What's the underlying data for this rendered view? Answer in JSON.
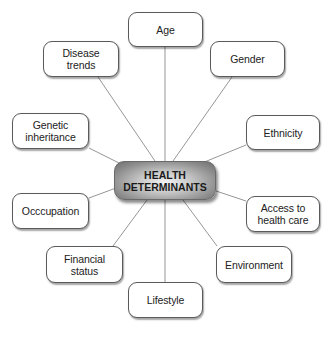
{
  "diagram": {
    "type": "mind-map",
    "center": {
      "label": "HEALTH\nDETERMINANTS",
      "x": 114,
      "y": 161,
      "w": 102,
      "h": 39
    },
    "line_color": "#8a8a8a",
    "nodes": [
      {
        "id": "age",
        "label": "Age",
        "x": 128,
        "y": 12,
        "w": 75,
        "h": 35
      },
      {
        "id": "disease-trends",
        "label": "Disease\ntrends",
        "x": 43,
        "y": 41,
        "w": 76,
        "h": 36
      },
      {
        "id": "gender",
        "label": "Gender",
        "x": 210,
        "y": 41,
        "w": 75,
        "h": 36
      },
      {
        "id": "genetic-inheritance",
        "label": "Genetic\ninheritance",
        "x": 12,
        "y": 113,
        "w": 77,
        "h": 36
      },
      {
        "id": "ethnicity",
        "label": "Ethnicity",
        "x": 246,
        "y": 115,
        "w": 74,
        "h": 35
      },
      {
        "id": "occupation",
        "label": "Occcupation",
        "x": 12,
        "y": 193,
        "w": 77,
        "h": 36
      },
      {
        "id": "access-to-health-care",
        "label": "Access to\nhealth care",
        "x": 246,
        "y": 196,
        "w": 74,
        "h": 36
      },
      {
        "id": "financial-status",
        "label": "Financial\nstatus",
        "x": 46,
        "y": 246,
        "w": 77,
        "h": 37
      },
      {
        "id": "environment",
        "label": "Environment",
        "x": 216,
        "y": 246,
        "w": 76,
        "h": 37
      },
      {
        "id": "lifestyle",
        "label": "Lifestyle",
        "x": 128,
        "y": 282,
        "w": 75,
        "h": 36
      }
    ],
    "edges": [
      {
        "to": "age",
        "x1": 165,
        "y1": 161,
        "x2": 165,
        "y2": 47
      },
      {
        "to": "disease-trends",
        "x1": 155,
        "y1": 161,
        "x2": 98,
        "y2": 77
      },
      {
        "to": "gender",
        "x1": 173,
        "y1": 161,
        "x2": 232,
        "y2": 77
      },
      {
        "to": "genetic-inheritance",
        "x1": 127,
        "y1": 167,
        "x2": 89,
        "y2": 148
      },
      {
        "to": "ethnicity",
        "x1": 202,
        "y1": 163,
        "x2": 246,
        "y2": 145
      },
      {
        "to": "occupation",
        "x1": 116,
        "y1": 188,
        "x2": 89,
        "y2": 198
      },
      {
        "to": "access-to-health-care",
        "x1": 216,
        "y1": 191,
        "x2": 246,
        "y2": 201
      },
      {
        "to": "financial-status",
        "x1": 147,
        "y1": 200,
        "x2": 113,
        "y2": 246
      },
      {
        "to": "environment",
        "x1": 183,
        "y1": 200,
        "x2": 217,
        "y2": 246
      },
      {
        "to": "lifestyle",
        "x1": 165,
        "y1": 200,
        "x2": 165,
        "y2": 282
      }
    ]
  }
}
